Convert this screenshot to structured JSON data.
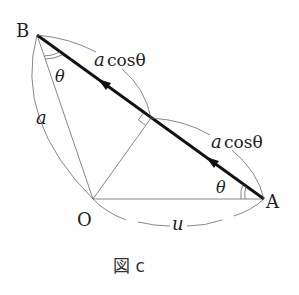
{
  "figure": {
    "caption": "図 c",
    "points": {
      "B": {
        "label": "B",
        "x": 37,
        "y": 35
      },
      "O": {
        "label": "O",
        "x": 93,
        "y": 199
      },
      "A": {
        "label": "A",
        "x": 264,
        "y": 199
      },
      "H": {
        "label": "",
        "x": 151,
        "y": 118
      }
    },
    "labels": {
      "side_BO": "a",
      "side_OA": "u",
      "segment_BH": "a cosθ",
      "segment_HA": "a cosθ",
      "angle_B": "θ",
      "angle_A": "θ",
      "seg_upper_a": "a",
      "seg_upper_cos": "cosθ",
      "seg_lower_a": "a",
      "seg_lower_cos": "cosθ"
    },
    "colors": {
      "main_line": "#111111",
      "thin_line": "#6a6a6a",
      "background": "#ffffff"
    }
  }
}
